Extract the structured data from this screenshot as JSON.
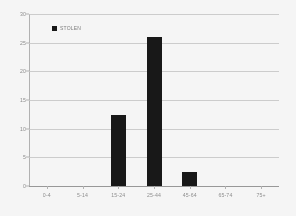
{
  "chart_data": {
    "type": "bar",
    "title": "",
    "subtitle": "",
    "xlabel": "",
    "ylabel": "",
    "categories": [
      "0-4",
      "5-14",
      "15-24",
      "25-44",
      "45-64",
      "65-74",
      "75+"
    ],
    "values": [
      0,
      0,
      12.3,
      26.0,
      2.4,
      0,
      0
    ],
    "series": [
      {
        "name": "STOLEN",
        "values": [
          0,
          0,
          12.3,
          26.0,
          2.4,
          0,
          0
        ],
        "color": "#111111"
      }
    ],
    "ylim": [
      0,
      30
    ],
    "yticks": [
      0,
      5,
      10,
      15,
      20,
      25,
      30
    ],
    "ytick_labels": [
      "0",
      "5",
      "10",
      "15",
      "20",
      "25",
      "30"
    ],
    "grid": true,
    "grid_axis": "y",
    "legend": {
      "position": "top-left",
      "entries": [
        {
          "label": "STOLEN",
          "color": "#111111",
          "marker": "square"
        }
      ]
    }
  },
  "colors": {
    "bar": "#111111",
    "grid": "#c9c9c9",
    "axis": "#b4b4b4",
    "tick_text": "#8c8c8c",
    "background": "#fdfdfd"
  }
}
